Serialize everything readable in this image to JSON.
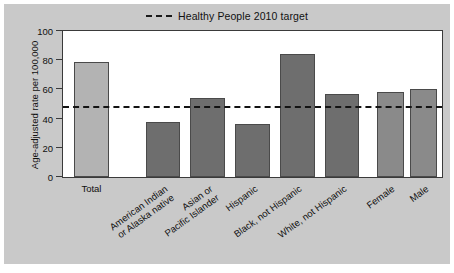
{
  "figure": {
    "background_color": "#c9c9c9",
    "plot_background_color": "#ffffff"
  },
  "legend": {
    "position": "top-center",
    "label": "Healthy People 2010 target",
    "line_style": "dashed",
    "line_color": "#131313"
  },
  "axis": {
    "y_title": "Age-adjusted rate per 100,000",
    "y_ticks": [
      "0",
      "20",
      "40",
      "60",
      "80",
      "100"
    ],
    "x_title": ""
  },
  "chart_data": {
    "type": "bar",
    "title": "",
    "subtitle": "",
    "xlabel": "",
    "ylabel": "Age-adjusted rate per 100,000",
    "ylim": [
      0,
      100
    ],
    "ytick_values": [
      0,
      20,
      40,
      60,
      80,
      100
    ],
    "grid": false,
    "legend_position": "top-center",
    "categories": [
      "Total",
      "American Indian\nor Alaska native",
      "Asian or\nPacific Islander",
      "Hispanic",
      "Black, not Hispanic",
      "White, not Hispanic",
      "Female",
      "Male"
    ],
    "values": [
      79,
      38,
      54,
      36,
      84,
      57,
      58,
      60
    ],
    "bar_colors": [
      "#b3b3b3",
      "#6e6e6e",
      "#6e6e6e",
      "#6e6e6e",
      "#6e6e6e",
      "#6e6e6e",
      "#8a8a8a",
      "#8a8a8a"
    ],
    "bars": [
      {
        "label": "Total",
        "label_lines": [
          "Total"
        ],
        "value": 79,
        "color": "#b3b3b3",
        "x_pct": 2.9,
        "w_pct": 9.2,
        "rotated": false
      },
      {
        "label": "American Indian or Alaska native",
        "label_lines": [
          "American Indian",
          "or Alaska native"
        ],
        "value": 38,
        "color": "#6e6e6e",
        "x_pct": 21.8,
        "w_pct": 9.2,
        "rotated": true
      },
      {
        "label": "Asian or Pacific Islander",
        "label_lines": [
          "Asian or",
          "Pacific Islander"
        ],
        "value": 54,
        "color": "#6e6e6e",
        "x_pct": 33.6,
        "w_pct": 9.2,
        "rotated": true
      },
      {
        "label": "Hispanic",
        "label_lines": [
          "Hispanic"
        ],
        "value": 36,
        "color": "#6e6e6e",
        "x_pct": 45.4,
        "w_pct": 9.2,
        "rotated": true
      },
      {
        "label": "Black, not Hispanic",
        "label_lines": [
          "Black, not Hispanic"
        ],
        "value": 84,
        "color": "#6e6e6e",
        "x_pct": 57.2,
        "w_pct": 9.2,
        "rotated": true
      },
      {
        "label": "White, not Hispanic",
        "label_lines": [
          "White, not Hispanic"
        ],
        "value": 57,
        "color": "#6e6e6e",
        "x_pct": 69.0,
        "w_pct": 9.2,
        "rotated": true
      },
      {
        "label": "Female",
        "label_lines": [
          "Female"
        ],
        "value": 58,
        "color": "#8a8a8a",
        "x_pct": 82.8,
        "w_pct": 7.1,
        "rotated": true
      },
      {
        "label": "Male",
        "label_lines": [
          "Male"
        ],
        "value": 60,
        "color": "#8a8a8a",
        "x_pct": 91.6,
        "w_pct": 7.1,
        "rotated": true
      }
    ],
    "reference_line": {
      "name": "Healthy People 2010 target",
      "value": 47,
      "style": "dashed",
      "color": "#131313"
    }
  }
}
